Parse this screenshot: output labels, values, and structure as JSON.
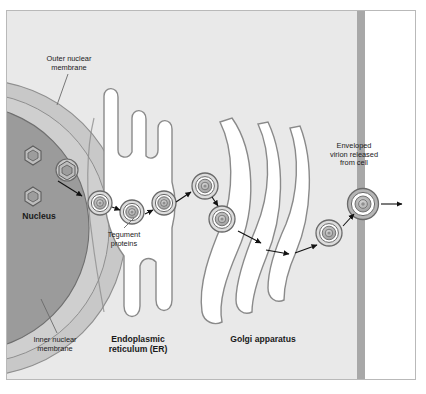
{
  "figure": {
    "type": "biological-cell-diagram"
  },
  "colors": {
    "cytoplasm": "#e9e9e9",
    "nucleoplasm": "#9a9a9a",
    "nuclear_envelope": "#c4c4c4",
    "organelle_lumen": "#ffffff",
    "membrane_stroke": "#8a8a8a",
    "plasma_membrane": "#a8a8a8",
    "extracellular": "#ffffff",
    "frame_border": "#b9b9b9",
    "text": "#1a1a1a",
    "arrow": "#111111",
    "capsid_core": "#b0b0b0"
  },
  "labels": [
    {
      "id": "outer-nuclear-membrane",
      "text": "Outer nuclear\nmembrane",
      "style": "thin",
      "x": 26,
      "y": 55,
      "width": 86
    },
    {
      "id": "nucleus",
      "text": "Nucleus",
      "style": "bold",
      "x": 8,
      "y": 212,
      "width": 62
    },
    {
      "id": "tegument-proteins",
      "text": "Tegument\nproteins",
      "style": "thin",
      "x": 92,
      "y": 231,
      "width": 64
    },
    {
      "id": "inner-nuclear-membrane",
      "text": "Inner nuclear\nmembrane",
      "style": "thin",
      "x": 20,
      "y": 336,
      "width": 70
    },
    {
      "id": "endoplasmic-reticulum",
      "text": "Endoplasmic\nreticulum (ER)",
      "style": "bold",
      "x": 92,
      "y": 335,
      "width": 92
    },
    {
      "id": "golgi-apparatus",
      "text": "Golgi apparatus",
      "style": "bold",
      "x": 216,
      "y": 335,
      "width": 94
    },
    {
      "id": "enveloped-virion-released",
      "text": "Enveloped\nvirion released\nfrom cell",
      "style": "thin",
      "x": 313,
      "y": 142,
      "width": 82
    }
  ],
  "structures": {
    "nucleus": {
      "name": "nucleus",
      "description": "large dark sphere at left with double nuclear envelope"
    },
    "nuclear_envelope": {
      "name": "nuclear-envelope",
      "description": "light band between inner and outer nuclear membranes"
    },
    "endoplasmic_reticulum": {
      "name": "endoplasmic-reticulum",
      "description": "white finger-like tubular projections adjacent to the nucleus"
    },
    "golgi": {
      "name": "golgi-apparatus",
      "cisternae_count": 3,
      "description": "three stacked curved white cisternae"
    },
    "plasma_membrane": {
      "name": "plasma-membrane",
      "description": "vertical gray band at the right edge of the cell"
    }
  },
  "particles": {
    "naked_capsids": [
      {
        "id": "capsid-nucleoplasm-1",
        "x": 33,
        "y": 155,
        "r": 9
      },
      {
        "id": "capsid-nucleoplasm-2",
        "x": 33,
        "y": 196,
        "r": 9
      },
      {
        "id": "capsid-at-inner-membrane",
        "x": 67,
        "y": 170,
        "r": 10
      }
    ],
    "enveloped_virions": [
      {
        "id": "virion-perinuclear",
        "x": 100,
        "y": 203,
        "r": 12
      },
      {
        "id": "virion-er-entry",
        "x": 132,
        "y": 212,
        "r": 12
      },
      {
        "id": "virion-er-lumen",
        "x": 164,
        "y": 203,
        "r": 12
      },
      {
        "id": "virion-er-exit",
        "x": 205,
        "y": 186,
        "r": 13
      },
      {
        "id": "virion-golgi-entry",
        "x": 222,
        "y": 219,
        "r": 13
      },
      {
        "id": "virion-post-golgi",
        "x": 329,
        "y": 233,
        "r": 13
      },
      {
        "id": "virion-budding",
        "x": 363,
        "y": 204,
        "r": 14
      }
    ]
  },
  "arrows": [
    {
      "id": "arrow-capsid-to-envelope",
      "from": [
        60,
        182
      ],
      "to": [
        84,
        197
      ]
    },
    {
      "id": "arrow-perinuclear-to-er",
      "from": [
        113,
        208
      ],
      "to": [
        121,
        211
      ]
    },
    {
      "id": "arrow-er-1",
      "from": [
        144,
        213
      ],
      "to": [
        153,
        209
      ]
    },
    {
      "id": "arrow-er-2",
      "from": [
        176,
        203
      ],
      "to": [
        192,
        192
      ]
    },
    {
      "id": "arrow-er-to-golgi",
      "from": [
        213,
        197
      ],
      "to": [
        219,
        207
      ]
    },
    {
      "id": "arrow-golgi-1",
      "from": [
        238,
        231
      ],
      "to": [
        262,
        243
      ]
    },
    {
      "id": "arrow-golgi-2",
      "from": [
        268,
        249
      ],
      "to": [
        290,
        254
      ]
    },
    {
      "id": "arrow-golgi-3",
      "from": [
        296,
        252
      ],
      "to": [
        318,
        244
      ]
    },
    {
      "id": "arrow-to-membrane",
      "from": [
        344,
        226
      ],
      "to": [
        356,
        215
      ]
    },
    {
      "id": "arrow-release",
      "from": [
        381,
        204
      ],
      "to": [
        403,
        204
      ]
    }
  ],
  "leader_lines": [
    {
      "id": "leader-outer-nuclear-membrane",
      "from": [
        68,
        74
      ],
      "to": [
        57,
        104
      ]
    },
    {
      "id": "leader-inner-nuclear-membrane",
      "from": [
        57,
        333
      ],
      "to": [
        41,
        300
      ]
    },
    {
      "id": "leader-tegument-proteins",
      "from": [
        124,
        229
      ],
      "to": [
        134,
        219
      ]
    }
  ]
}
